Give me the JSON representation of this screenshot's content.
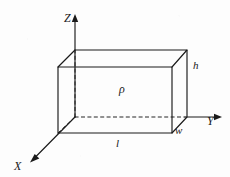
{
  "figure": {
    "background_color": "#fdfdfd",
    "line_color": "#1a1a1a",
    "axes": [
      {
        "name": "z-axis",
        "label": "Z",
        "direction": "up"
      },
      {
        "name": "y-axis",
        "label": "Y",
        "direction": "right"
      },
      {
        "name": "x-axis",
        "label": "X",
        "direction": "down-left"
      }
    ],
    "dimension_labels": [
      {
        "name": "height",
        "label": "h",
        "edge": "front-right-vertical"
      },
      {
        "name": "width",
        "label": "w",
        "edge": "bottom-right-depth"
      },
      {
        "name": "length",
        "label": "l",
        "edge": "front-bottom-horizontal"
      }
    ],
    "body_label": {
      "name": "density",
      "label": "ρ"
    },
    "labels": {
      "z": "Z",
      "y": "Y",
      "x": "X",
      "h": "h",
      "w": "w",
      "l": "l",
      "rho": "ρ"
    }
  }
}
